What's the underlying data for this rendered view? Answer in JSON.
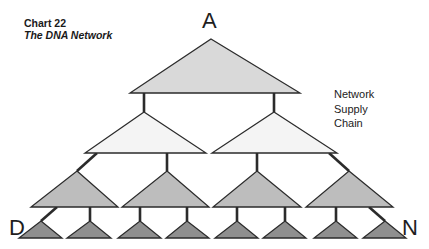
{
  "title": {
    "line1": "Chart 22",
    "line2": "The DNA Network"
  },
  "labels": {
    "top": "A",
    "bottom_left": "D",
    "bottom_right": "N"
  },
  "legend": {
    "line1": "Network",
    "line2": "Supply",
    "line3": "Chain"
  },
  "colors": {
    "level1_fill": "#d9d9d9",
    "level2_fill": "#f4f4f4",
    "level3_fill": "#bdbdbd",
    "level4_fill": "#8f8f8f",
    "stroke": "#2b2b2b"
  },
  "tree": {
    "levels": [
      {
        "level": 1,
        "count": 1
      },
      {
        "level": 2,
        "count": 2
      },
      {
        "level": 3,
        "count": 4
      },
      {
        "level": 4,
        "count": 8
      }
    ]
  }
}
